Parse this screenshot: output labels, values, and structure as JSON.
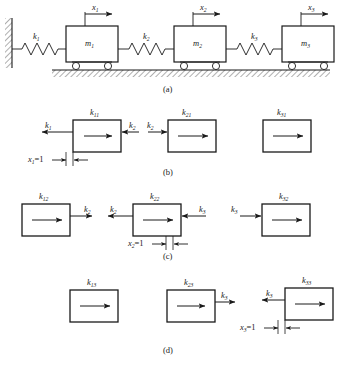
{
  "figure": {
    "background": "#ffffff",
    "ink": "#1a1a1a",
    "panels": [
      {
        "id": "a",
        "caption": "(a)",
        "type": "physical-system",
        "description": "Three masses connected in series by springs to a fixed wall, resting on wheels on hatched ground",
        "wall": "fixed-hatched-wall",
        "ground": "hatched-ground",
        "masses": [
          {
            "label": "m",
            "sub": "1"
          },
          {
            "label": "m",
            "sub": "2"
          },
          {
            "label": "m",
            "sub": "3"
          }
        ],
        "springs": [
          {
            "label": "k",
            "sub": "1"
          },
          {
            "label": "k",
            "sub": "2"
          },
          {
            "label": "k",
            "sub": "3"
          }
        ],
        "displacements": [
          {
            "label": "x",
            "sub": "1"
          },
          {
            "label": "x",
            "sub": "2"
          },
          {
            "label": "x",
            "sub": "3"
          }
        ]
      },
      {
        "id": "b",
        "caption": "(b)",
        "type": "free-body-unit-displacement",
        "applied_displacement": {
          "text": "x",
          "sub": "1",
          "value": "=1"
        },
        "boxes": [
          {
            "stiffness": {
              "label": "k",
              "sub": "11"
            },
            "inner_arrow": "right",
            "forces": [
              {
                "label": "k",
                "sub": "1",
                "side": "left",
                "direction": "left"
              },
              {
                "label": "k",
                "sub": "2",
                "side": "right",
                "direction": "left"
              }
            ]
          },
          {
            "stiffness": {
              "label": "k",
              "sub": "21"
            },
            "inner_arrow": "right",
            "forces": [
              {
                "label": "k",
                "sub": "2",
                "side": "left",
                "direction": "right"
              }
            ]
          },
          {
            "stiffness": {
              "label": "k",
              "sub": "31"
            },
            "inner_arrow": "right",
            "forces": []
          }
        ]
      },
      {
        "id": "c",
        "caption": "(c)",
        "type": "free-body-unit-displacement",
        "applied_displacement": {
          "text": "x",
          "sub": "2",
          "value": "=1"
        },
        "boxes": [
          {
            "stiffness": {
              "label": "k",
              "sub": "12"
            },
            "inner_arrow": "right",
            "forces": [
              {
                "label": "k",
                "sub": "2",
                "side": "right",
                "direction": "right"
              }
            ]
          },
          {
            "stiffness": {
              "label": "k",
              "sub": "22"
            },
            "inner_arrow": "right",
            "forces": [
              {
                "label": "k",
                "sub": "2",
                "side": "left",
                "direction": "left"
              },
              {
                "label": "k",
                "sub": "3",
                "side": "right",
                "direction": "left"
              }
            ]
          },
          {
            "stiffness": {
              "label": "k",
              "sub": "32"
            },
            "inner_arrow": "right",
            "forces": [
              {
                "label": "k",
                "sub": "3",
                "side": "left",
                "direction": "right"
              }
            ]
          }
        ]
      },
      {
        "id": "d",
        "caption": "(d)",
        "type": "free-body-unit-displacement",
        "applied_displacement": {
          "text": "x",
          "sub": "3",
          "value": "=1"
        },
        "boxes": [
          {
            "stiffness": {
              "label": "k",
              "sub": "13"
            },
            "inner_arrow": "right",
            "forces": []
          },
          {
            "stiffness": {
              "label": "k",
              "sub": "23"
            },
            "inner_arrow": "right",
            "forces": [
              {
                "label": "k",
                "sub": "3",
                "side": "right",
                "direction": "right"
              }
            ]
          },
          {
            "stiffness": {
              "label": "k",
              "sub": "33"
            },
            "inner_arrow": "right",
            "forces": [
              {
                "label": "k",
                "sub": "3",
                "side": "left",
                "direction": "left"
              }
            ]
          }
        ]
      }
    ]
  },
  "labels": {
    "a": {
      "m1": "m",
      "m1s": "1",
      "m2": "m",
      "m2s": "2",
      "m3": "m",
      "m3s": "3",
      "k1": "k",
      "k1s": "1",
      "k2": "k",
      "k2s": "2",
      "k3": "k",
      "k3s": "3",
      "x1": "x",
      "x1s": "1",
      "x2": "x",
      "x2s": "2",
      "x3": "x",
      "x3s": "3",
      "caption": "(a)"
    },
    "b": {
      "k11": "k",
      "k11s": "11",
      "k21": "k",
      "k21s": "21",
      "k31": "k",
      "k31s": "31",
      "f_k1": "k",
      "f_k1s": "1",
      "f_k2r": "k",
      "f_k2rs": "2",
      "f_k2l": "k",
      "f_k2ls": "2",
      "disp": "x",
      "disps": "1",
      "dispv": "=1",
      "caption": "(b)"
    },
    "c": {
      "k12": "k",
      "k12s": "12",
      "k22": "k",
      "k22s": "22",
      "k32": "k",
      "k32s": "32",
      "f_k2a": "k",
      "f_k2as": "2",
      "f_k2b": "k",
      "f_k2bs": "2",
      "f_k3a": "k",
      "f_k3as": "3",
      "f_k3b": "k",
      "f_k3bs": "3",
      "disp": "x",
      "disps": "2",
      "dispv": "=1",
      "caption": "(c)"
    },
    "d": {
      "k13": "k",
      "k13s": "13",
      "k23": "k",
      "k23s": "23",
      "k33": "k",
      "k33s": "33",
      "f_k3a": "k",
      "f_k3as": "3",
      "f_k3b": "k",
      "f_k3bs": "3",
      "disp": "x",
      "disps": "3",
      "dispv": "=1",
      "caption": "(d)"
    }
  }
}
